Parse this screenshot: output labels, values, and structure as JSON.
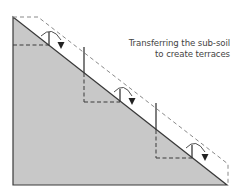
{
  "diagram": {
    "caption": {
      "line1": "Transferring the sub-soil",
      "line2": "to create terraces"
    },
    "colors": {
      "soil_fill": "#c8c8c8",
      "outline": "#3a3a3a",
      "dashed": "#8a8a8a",
      "text": "#444444"
    },
    "elements": [
      "sloped-soil-triangle",
      "original-slope-dashed-outline",
      "terrace-step-1",
      "terrace-step-2",
      "terrace-step-3",
      "transfer-arrow-1",
      "transfer-arrow-2",
      "transfer-arrow-3"
    ]
  }
}
